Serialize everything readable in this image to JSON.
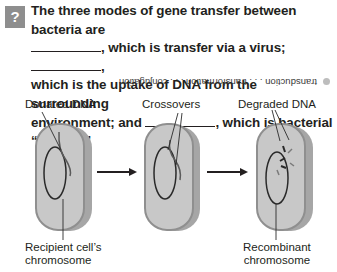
{
  "question": {
    "icon": "question-mark-icon",
    "icon_glyph": "?",
    "part1": "The three modes of gene transfer between bacteria are",
    "part2": ", which is transfer via a virus; ",
    "part3": ",",
    "part4": "which is the uptake of DNA from the surrounding",
    "part5": "environment; and ",
    "part6": ", which is bacterial “mating.”"
  },
  "answer": {
    "text": "transduction . . . transformation . . . conjugation",
    "orientation": "upside-down"
  },
  "diagram": {
    "labels": {
      "donated_dna": "Donated DNA",
      "recipient_chromosome_line1": "Recipient cell’s",
      "recipient_chromosome_line2": "chromosome",
      "crossovers": "Crossovers",
      "degraded_dna": "Degraded DNA",
      "recombinant_line1": "Recombinant",
      "recombinant_line2": "chromosome"
    },
    "colors": {
      "cell_fill": "#c8c8c8",
      "cell_edge": "#8f8f8f",
      "cell_side": "#a6a6a6",
      "dna": "#2a2a2a",
      "donated": "#6b6b6b"
    }
  }
}
